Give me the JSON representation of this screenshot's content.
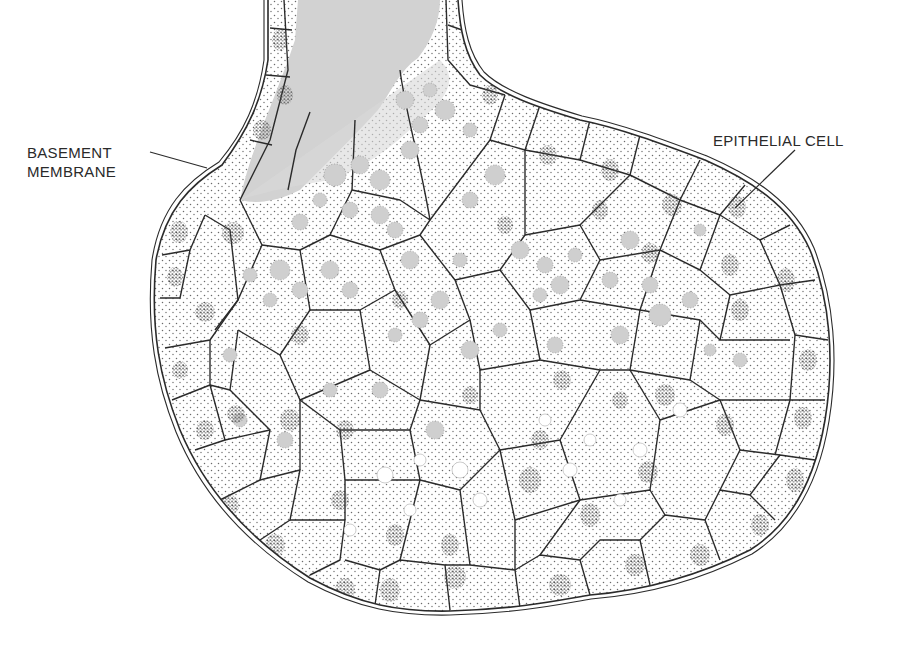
{
  "figure": {
    "colors": {
      "background": "#ffffff",
      "outline": "#2b2b2b",
      "stipple": "#6a6a6a",
      "nucleus": "#555555",
      "lumen_gray": "#d2d2d2",
      "vacuole_gray": "#cfcfcf",
      "vacuole_white": "#ffffff"
    }
  },
  "labels": {
    "basement_membrane": {
      "line1": "BASEMENT",
      "line2": "MEMBRANE"
    },
    "epithelial_cell": {
      "text": "EPITHELIAL CELL"
    }
  }
}
